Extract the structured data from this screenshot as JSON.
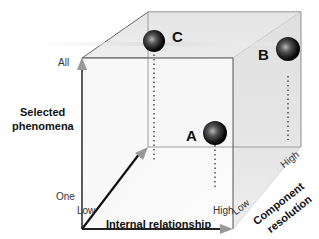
{
  "diagram": {
    "type": "3d-cube-space",
    "axes": {
      "y": {
        "title_line1": "Selected",
        "title_line2": "phenomena",
        "low_tick": "One",
        "high_tick": "All"
      },
      "x": {
        "title": "Internal relationship",
        "low_tick": "Low",
        "high_tick": "High"
      },
      "z": {
        "title_line1": "Component",
        "title_line2": "resolution",
        "low_tick": "Low",
        "high_tick": "High"
      }
    },
    "points": [
      {
        "label": "A",
        "x": "High",
        "y": "One",
        "z": "Low"
      },
      {
        "label": "B",
        "x": "High",
        "y": "All",
        "z": "High"
      },
      {
        "label": "C",
        "x": "Low",
        "y": "All",
        "z": "High"
      }
    ],
    "colors": {
      "cube_edge": "#555555",
      "arrow_gray": "#999999",
      "arrow_dark": "#111111",
      "face_light": "#f2f2f2",
      "face_side": "#dcdcdc",
      "sphere": "#111111"
    }
  }
}
